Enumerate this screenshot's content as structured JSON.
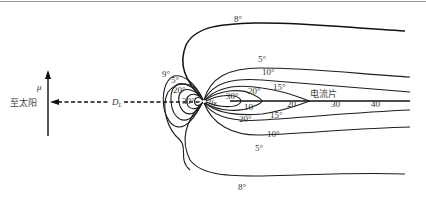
{
  "figure": {
    "axis_label": "μ",
    "sun_direction_label": "至太阳",
    "distance_label": "D",
    "distance_subscript": "L",
    "body_label": "u",
    "body_subscript": "E",
    "current_sheet_label": "电流片",
    "tail_distance_ticks": [
      "10",
      "20",
      "30",
      "40"
    ],
    "contour_labels": {
      "upper_outer": "8°",
      "lower_outer": "8°",
      "upper_5": "5°",
      "upper_10": "10°",
      "upper_15": "15°",
      "upper_20_right": "20°",
      "upper_30_right": "30°",
      "lower_20_right": "20°",
      "lower_15": "15°",
      "lower_10": "10°",
      "lower_5": "5°",
      "left_9": "9°",
      "left_5": "5°",
      "left_20": "20°",
      "left_30": "30°"
    },
    "colors": {
      "line": "#1e1e1e",
      "text": "#333333",
      "rule": "#9a9a9a"
    }
  }
}
